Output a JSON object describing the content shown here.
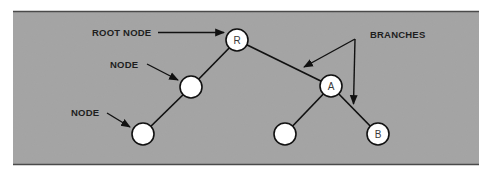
{
  "diagram": {
    "type": "tree-structure-illustration",
    "colors": {
      "panel_background": "#a3a3a3",
      "panel_border": "#4a4a4a",
      "node_fill": "#ffffff",
      "node_stroke": "#111111",
      "edge_color": "#111111",
      "label_color": "#1e1e1e"
    },
    "labels": {
      "root_node": "ROOT NODE",
      "node_upper": "NODE",
      "node_lower": "NODE",
      "branches": "BRANCHES"
    },
    "nodes": [
      {
        "id": "R",
        "label": "R",
        "x": 237,
        "y": 40,
        "role": "root"
      },
      {
        "id": "N1",
        "label": "",
        "x": 191,
        "y": 87,
        "role": "node"
      },
      {
        "id": "N2",
        "label": "",
        "x": 143,
        "y": 134,
        "role": "node"
      },
      {
        "id": "A",
        "label": "A",
        "x": 331,
        "y": 86,
        "role": "node"
      },
      {
        "id": "N3",
        "label": "",
        "x": 285,
        "y": 134,
        "role": "leaf"
      },
      {
        "id": "B",
        "label": "B",
        "x": 378,
        "y": 134,
        "role": "leaf"
      }
    ],
    "edges": [
      {
        "from": "R",
        "to": "N1"
      },
      {
        "from": "N1",
        "to": "N2"
      },
      {
        "from": "R",
        "to": "A"
      },
      {
        "from": "A",
        "to": "N3"
      },
      {
        "from": "A",
        "to": "B"
      }
    ],
    "annotations": [
      {
        "text_key": "root_node",
        "points_to": "R"
      },
      {
        "text_key": "node_upper",
        "points_to": "N1"
      },
      {
        "text_key": "node_lower",
        "points_to": "N2"
      },
      {
        "text_key": "branches",
        "points_to": [
          "edge R-A",
          "edge A-B"
        ]
      }
    ]
  }
}
